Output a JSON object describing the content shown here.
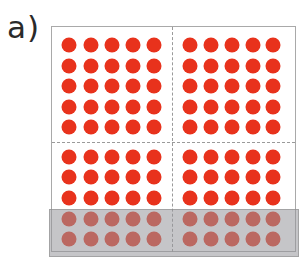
{
  "label": "a)",
  "colors": {
    "dot": "#e8321c",
    "overlay": "rgba(150,150,155,0.55)",
    "frame": "#a9a9a9",
    "dash": "#9a9a9a"
  },
  "grid": {
    "blocks": [
      {
        "name": "top-left",
        "cols": 5,
        "rows": 5
      },
      {
        "name": "top-right",
        "cols": 5,
        "rows": 5
      },
      {
        "name": "bottom-left",
        "cols": 5,
        "rows": 5
      },
      {
        "name": "bottom-right",
        "cols": 5,
        "rows": 5
      }
    ],
    "col_centers_left": [
      69,
      91,
      112,
      133,
      154
    ],
    "col_centers_right": [
      190,
      211,
      232,
      253,
      273
    ],
    "row_centers_top": [
      45,
      66,
      86,
      107,
      127
    ],
    "row_centers_bottom": [
      157,
      177,
      198,
      219,
      239
    ],
    "covered_rows_bottom": 2,
    "total_dots": 100,
    "covered_dots": 20
  }
}
